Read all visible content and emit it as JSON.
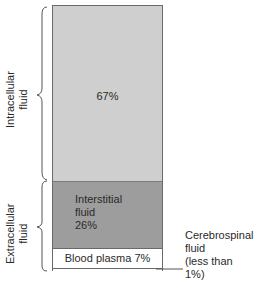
{
  "diagram": {
    "title": "",
    "compartments": [
      {
        "id": "intracellular",
        "label": "",
        "percent_label": "67%",
        "percent": 67,
        "color": "#cfcfcf"
      },
      {
        "id": "interstitial",
        "label_lines": [
          "Interstitial",
          "fluid",
          "26%"
        ],
        "percent": 26,
        "color": "#9d9d9d"
      },
      {
        "id": "blood_plasma",
        "label": "Blood plasma 7%",
        "percent": 7,
        "color": "#ffffff"
      },
      {
        "id": "cerebrospinal",
        "label_lines": [
          "Cerebrospinal",
          "fluid",
          "(less than 1%)"
        ],
        "percent": "<1",
        "color": "#ffffff"
      }
    ],
    "groups": [
      {
        "id": "intracellular_group",
        "label_lines": [
          "Intracellular",
          "fluid"
        ]
      },
      {
        "id": "extracellular_group",
        "label_lines": [
          "Extracellular",
          "fluid"
        ]
      }
    ]
  }
}
